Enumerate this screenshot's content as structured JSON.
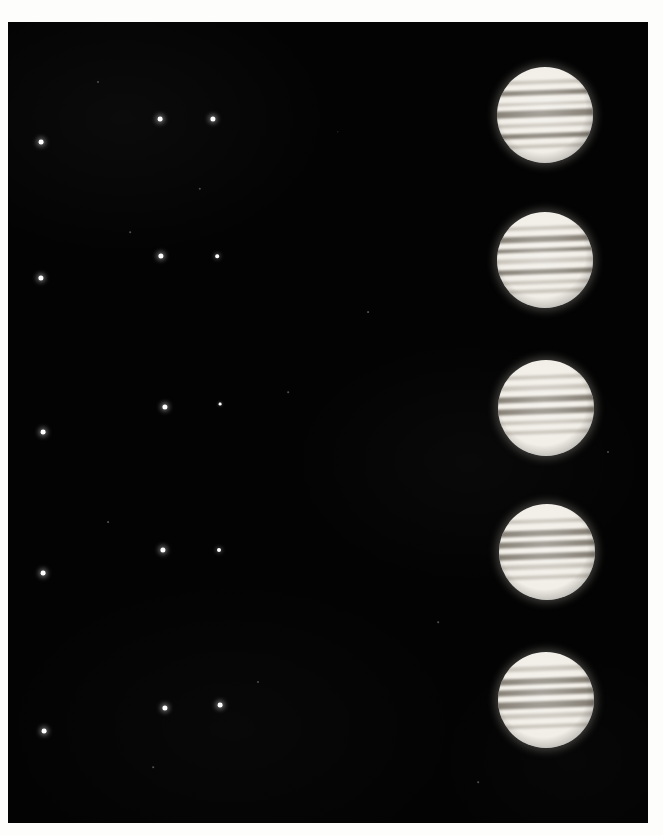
{
  "plate": {
    "title": "Jupiter and the Galilean moons — five-night photographic sequence",
    "medium": "photographic print",
    "paper_color": "#fdfdfb",
    "sky_color": "#030303",
    "planet_color": "#f2efe8",
    "moon_color": "#ffffff",
    "field": {
      "x": 8,
      "y": 22,
      "width": 640,
      "height": 801
    }
  },
  "rows": [
    {
      "name": "exposure-1",
      "planet": {
        "cx": 537,
        "cy": 93,
        "r": 48,
        "tilt_deg": -2
      },
      "belts": [
        {
          "top": 14,
          "height": 4,
          "style": "soft"
        },
        {
          "top": 24,
          "height": 5,
          "style": "dark"
        },
        {
          "top": 36,
          "height": 4,
          "style": "soft"
        },
        {
          "top": 45,
          "height": 7,
          "style": "dark"
        },
        {
          "top": 58,
          "height": 5,
          "style": "soft"
        },
        {
          "top": 69,
          "height": 5,
          "style": "dark"
        },
        {
          "top": 80,
          "height": 4,
          "style": "soft"
        }
      ],
      "moons": [
        {
          "name": "moon-a",
          "cx": 33,
          "cy": 120,
          "r": 2.4,
          "style": "bright"
        },
        {
          "name": "moon-b",
          "cx": 152,
          "cy": 97,
          "r": 2.4,
          "style": "bright"
        },
        {
          "name": "moon-c",
          "cx": 205,
          "cy": 97,
          "r": 2.6,
          "style": "bright"
        }
      ]
    },
    {
      "name": "exposure-2",
      "planet": {
        "cx": 537,
        "cy": 238,
        "r": 48,
        "tilt_deg": -2
      },
      "belts": [
        {
          "top": 15,
          "height": 4,
          "style": "soft"
        },
        {
          "top": 25,
          "height": 6,
          "style": "dark"
        },
        {
          "top": 37,
          "height": 5,
          "style": "dark"
        },
        {
          "top": 48,
          "height": 5,
          "style": "soft"
        },
        {
          "top": 59,
          "height": 6,
          "style": "dark"
        },
        {
          "top": 71,
          "height": 4,
          "style": "soft"
        },
        {
          "top": 80,
          "height": 4,
          "style": "soft"
        }
      ],
      "moons": [
        {
          "name": "moon-a",
          "cx": 33,
          "cy": 256,
          "r": 2.6,
          "style": "bright"
        },
        {
          "name": "moon-b",
          "cx": 153,
          "cy": 234,
          "r": 2.6,
          "style": "bright"
        },
        {
          "name": "moon-c",
          "cx": 209,
          "cy": 234,
          "r": 1.8,
          "style": "mid"
        }
      ]
    },
    {
      "name": "exposure-3",
      "planet": {
        "cx": 538,
        "cy": 386,
        "r": 48,
        "tilt_deg": -2
      },
      "belts": [
        {
          "top": 16,
          "height": 4,
          "style": "soft"
        },
        {
          "top": 26,
          "height": 5,
          "style": "soft"
        },
        {
          "top": 37,
          "height": 7,
          "style": "dark"
        },
        {
          "top": 50,
          "height": 6,
          "style": "dark"
        },
        {
          "top": 62,
          "height": 5,
          "style": "soft"
        },
        {
          "top": 73,
          "height": 4,
          "style": "soft"
        }
      ],
      "moons": [
        {
          "name": "moon-a",
          "cx": 35,
          "cy": 410,
          "r": 2.4,
          "style": "bright"
        },
        {
          "name": "moon-b",
          "cx": 157,
          "cy": 385,
          "r": 2.6,
          "style": "bright"
        },
        {
          "name": "moon-c",
          "cx": 212,
          "cy": 382,
          "r": 1.4,
          "style": "faint"
        }
      ]
    },
    {
      "name": "exposure-4",
      "planet": {
        "cx": 539,
        "cy": 530,
        "r": 48,
        "tilt_deg": -2
      },
      "belts": [
        {
          "top": 16,
          "height": 4,
          "style": "soft"
        },
        {
          "top": 27,
          "height": 6,
          "style": "dark"
        },
        {
          "top": 39,
          "height": 6,
          "style": "dark"
        },
        {
          "top": 51,
          "height": 6,
          "style": "dark"
        },
        {
          "top": 63,
          "height": 5,
          "style": "soft"
        },
        {
          "top": 74,
          "height": 4,
          "style": "soft"
        }
      ],
      "moons": [
        {
          "name": "moon-a",
          "cx": 35,
          "cy": 551,
          "r": 2.4,
          "style": "bright"
        },
        {
          "name": "moon-b",
          "cx": 155,
          "cy": 528,
          "r": 2.6,
          "style": "bright"
        },
        {
          "name": "moon-c",
          "cx": 211,
          "cy": 528,
          "r": 2.0,
          "style": "mid"
        }
      ]
    },
    {
      "name": "exposure-5",
      "planet": {
        "cx": 538,
        "cy": 678,
        "r": 48,
        "tilt_deg": -2
      },
      "belts": [
        {
          "top": 15,
          "height": 5,
          "style": "soft"
        },
        {
          "top": 27,
          "height": 6,
          "style": "dark"
        },
        {
          "top": 39,
          "height": 6,
          "style": "dark"
        },
        {
          "top": 51,
          "height": 7,
          "style": "dark"
        },
        {
          "top": 64,
          "height": 5,
          "style": "soft"
        },
        {
          "top": 75,
          "height": 4,
          "style": "soft"
        }
      ],
      "moons": [
        {
          "name": "moon-a",
          "cx": 36,
          "cy": 709,
          "r": 2.4,
          "style": "bright"
        },
        {
          "name": "moon-b",
          "cx": 157,
          "cy": 686,
          "r": 2.6,
          "style": "bright"
        },
        {
          "name": "moon-c",
          "cx": 212,
          "cy": 683,
          "r": 2.4,
          "style": "bright"
        }
      ]
    }
  ],
  "specks": [
    {
      "cx": 90,
      "cy": 60,
      "r": 1.0
    },
    {
      "cx": 192,
      "cy": 167,
      "r": 1.2
    },
    {
      "cx": 122,
      "cy": 210,
      "r": 0.8
    },
    {
      "cx": 360,
      "cy": 290,
      "r": 0.9
    },
    {
      "cx": 280,
      "cy": 370,
      "r": 0.8
    },
    {
      "cx": 100,
      "cy": 500,
      "r": 0.9
    },
    {
      "cx": 430,
      "cy": 600,
      "r": 0.8
    },
    {
      "cx": 250,
      "cy": 660,
      "r": 1.0
    },
    {
      "cx": 145,
      "cy": 745,
      "r": 0.8
    },
    {
      "cx": 600,
      "cy": 430,
      "r": 1.0
    },
    {
      "cx": 330,
      "cy": 110,
      "r": 0.7
    },
    {
      "cx": 470,
      "cy": 760,
      "r": 0.8
    }
  ]
}
